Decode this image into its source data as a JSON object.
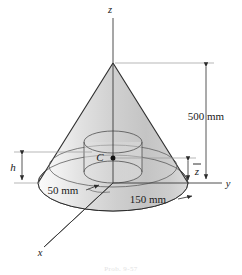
{
  "figure": {
    "caption": "Prob. 9-57",
    "axes": [
      {
        "name": "z-axis",
        "label": "z"
      },
      {
        "name": "y-axis",
        "label": "y"
      },
      {
        "name": "x-axis",
        "label": "x"
      }
    ],
    "point_labels": [
      {
        "name": "centroid",
        "label": "C"
      }
    ],
    "dimensions": [
      {
        "name": "cone-height",
        "label": "500 mm",
        "value": 500,
        "unit": "mm"
      },
      {
        "name": "inner-radius",
        "label": "50 mm",
        "value": 50,
        "unit": "mm"
      },
      {
        "name": "base-radius",
        "label": "150 mm",
        "value": 150,
        "unit": "mm"
      },
      {
        "name": "cylinder-height",
        "label": "h"
      },
      {
        "name": "centroid-height",
        "label": "z"
      }
    ],
    "colors": {
      "outline": "#2b2b2b",
      "thin_line": "#5a5a5a",
      "surface_light": "#f4f4f4",
      "surface_mid": "#d2d2d2",
      "surface_dark": "#b4b4b4",
      "base_fill": "#cccccc",
      "text": "#1a1a1a"
    }
  }
}
